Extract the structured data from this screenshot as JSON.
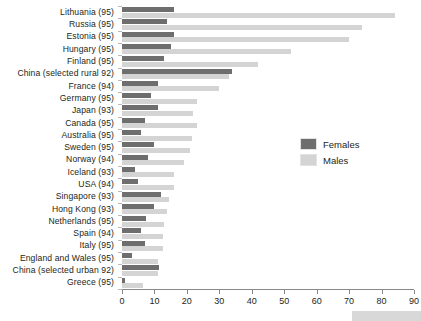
{
  "chart_data": {
    "type": "bar",
    "orientation": "horizontal",
    "title": "",
    "xlabel": "",
    "ylabel": "",
    "xlim": [
      0,
      90
    ],
    "xticks": [
      0,
      10,
      20,
      30,
      40,
      50,
      60,
      70,
      80,
      90
    ],
    "grid": false,
    "legend_position": "center-right",
    "categories": [
      "Lithuania (95)",
      "Russia (95)",
      "Estonia (95)",
      "Hungary (95)",
      "Finland (95)",
      "China (selected rural 92)",
      "France (94)",
      "Germany (95)",
      "Japan (93)",
      "Canada (95)",
      "Australia (95)",
      "Sweden (95)",
      "Norway (94)",
      "Iceland (93)",
      "USA (94)",
      "Singapore (93)",
      "Hong Kong (93)",
      "Netherlands (95)",
      "Spain (94)",
      "Italy (95)",
      "England and Wales (95)",
      "China (selected urban 92)",
      "Greece (95)"
    ],
    "series": [
      {
        "name": "Females",
        "color": "#6e6e6e",
        "values": [
          16,
          14,
          16,
          15,
          13,
          34,
          11,
          9,
          11,
          7,
          6,
          10,
          8,
          4,
          5,
          12,
          10,
          7.5,
          6,
          7,
          3,
          11.5,
          1
        ]
      },
      {
        "name": "Males",
        "color": "#d4d4d4",
        "values": [
          84,
          74,
          70,
          52,
          42,
          33,
          30,
          23,
          22,
          23,
          21.5,
          21,
          19,
          16,
          16,
          14.5,
          14,
          13,
          12.5,
          12.5,
          11,
          11,
          6.5
        ]
      }
    ]
  },
  "legend": {
    "entries": [
      {
        "label": "Females",
        "color": "#6e6e6e"
      },
      {
        "label": "Males",
        "color": "#d4d4d4"
      }
    ]
  }
}
